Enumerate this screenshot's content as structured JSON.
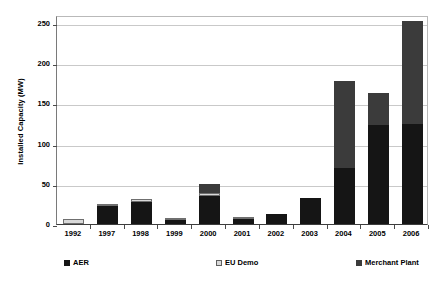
{
  "chart_data": {
    "type": "bar",
    "stacked": true,
    "title": "",
    "xlabel": "",
    "ylabel": "Installed Capacity (MW)",
    "categories": [
      "1992",
      "1997",
      "1998",
      "1999",
      "2000",
      "2001",
      "2002",
      "2003",
      "2004",
      "2005",
      "2006"
    ],
    "yticks": [
      0,
      50,
      100,
      150,
      200,
      250
    ],
    "ylim": [
      0,
      260
    ],
    "grid": true,
    "legend_position": "bottom",
    "series": [
      {
        "name": "AER",
        "color": "#151515",
        "values": [
          0,
          22,
          28,
          5,
          35,
          6,
          13,
          32,
          70,
          123,
          125
        ]
      },
      {
        "name": "EU Demo",
        "color": "#d9d9d9",
        "values": [
          6,
          2,
          3,
          2,
          3,
          1,
          0,
          0,
          0,
          0,
          0
        ]
      },
      {
        "name": "Merchant Plant",
        "color": "#3b3b3b",
        "values": [
          0,
          0,
          0,
          0,
          12,
          0,
          0,
          0,
          108,
          40,
          127
        ]
      }
    ],
    "totals": [
      6,
      24,
      31,
      7,
      50,
      7,
      13,
      32,
      178,
      163,
      252
    ]
  },
  "legend": {
    "entries": [
      {
        "label": "AER",
        "color": "#151515"
      },
      {
        "label": "EU Demo",
        "color": "#d9d9d9"
      },
      {
        "label": "Merchant Plant",
        "color": "#3b3b3b"
      }
    ]
  }
}
